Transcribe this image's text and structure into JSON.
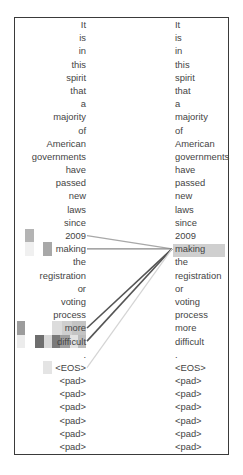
{
  "diagram": {
    "type": "attention-alignment",
    "source_tokens": [
      "It",
      "is",
      "in",
      "this",
      "spirit",
      "that",
      "a",
      "majority",
      "of",
      "American",
      "governments",
      "have",
      "passed",
      "new",
      "laws",
      "since",
      "2009",
      "making",
      "the",
      "registration",
      "or",
      "voting",
      "process",
      "more",
      "difficult",
      ".",
      "<EOS>",
      "<pad>",
      "<pad>",
      "<pad>",
      "<pad>",
      "<pad>",
      "<pad>"
    ],
    "target_tokens": [
      "It",
      "is",
      "in",
      "this",
      "spirit",
      "that",
      "a",
      "majority",
      "of",
      "American",
      "governments",
      "have",
      "passed",
      "new",
      "laws",
      "since",
      "2009",
      "making",
      "the",
      "registration",
      "or",
      "voting",
      "process",
      "more",
      "difficult",
      ".",
      "<EOS>",
      "<pad>",
      "<pad>",
      "<pad>",
      "<pad>",
      "<pad>",
      "<pad>"
    ],
    "highlighted_target_index": 17,
    "highlighted_target_token": "making",
    "links": [
      {
        "from": "2009",
        "from_index": 16,
        "to": "making",
        "strength": "light",
        "color": "#a8a8a8"
      },
      {
        "from": "making",
        "from_index": 17,
        "to": "making",
        "strength": "medium",
        "color": "#888888"
      },
      {
        "from": "more",
        "from_index": 23,
        "to": "making",
        "strength": "strong",
        "color": "#555555"
      },
      {
        "from": "difficult",
        "from_index": 24,
        "to": "making",
        "strength": "strong",
        "color": "#555555"
      },
      {
        "from": "<EOS>",
        "from_index": 26,
        "to": "making",
        "strength": "faint",
        "color": "#d4d4d4"
      }
    ],
    "heat_cells": [
      {
        "row": 16,
        "x": 25,
        "w": 9,
        "color": "#b4b4b4"
      },
      {
        "row": 17,
        "x": 25,
        "w": 9,
        "color": "#f0f0f0"
      },
      {
        "row": 17,
        "x": 43,
        "w": 9,
        "color": "#a8a8a8"
      },
      {
        "row": 23,
        "x": 17,
        "w": 8,
        "color": "#9c9c9c"
      },
      {
        "row": 23,
        "x": 52,
        "w": 10,
        "color": "#dcdcdc"
      },
      {
        "row": 23,
        "x": 62,
        "w": 10,
        "color": "#cfcfcf"
      },
      {
        "row": 23,
        "x": 72,
        "w": 14,
        "color": "#c4c4c4"
      },
      {
        "row": 24,
        "x": 17,
        "w": 8,
        "color": "#ececec"
      },
      {
        "row": 24,
        "x": 35,
        "w": 9,
        "color": "#6e6e6e"
      },
      {
        "row": 24,
        "x": 44,
        "w": 8,
        "color": "#d8d8d8"
      },
      {
        "row": 24,
        "x": 52,
        "w": 8,
        "color": "#7a7a7a"
      },
      {
        "row": 24,
        "x": 60,
        "w": 10,
        "color": "#a0a0a0"
      },
      {
        "row": 24,
        "x": 70,
        "w": 8,
        "color": "#e2e2e2"
      },
      {
        "row": 24,
        "x": 78,
        "w": 8,
        "color": "#bcbcbc"
      },
      {
        "row": 26,
        "x": 43,
        "w": 9,
        "color": "#e4e4e4"
      }
    ]
  }
}
